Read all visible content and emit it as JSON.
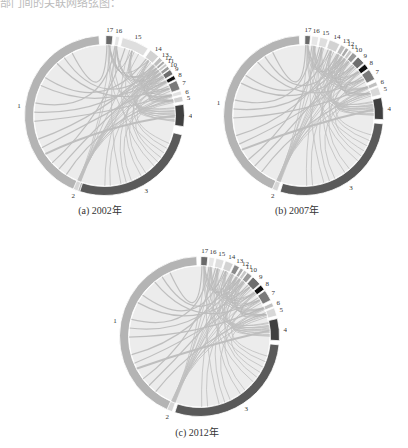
{
  "header": {
    "text": "部门间的关联网络弦图："
  },
  "chart_data": [
    {
      "type": "chord",
      "title": "(a) 2002年",
      "caption": "(a) 2002年",
      "segments": [
        {
          "id": "1",
          "start": 197,
          "end": 356,
          "color": "#b4b4b4"
        },
        {
          "id": "2",
          "start": 199.5,
          "end": 203,
          "color": "#d6d6d6"
        },
        {
          "id": "3",
          "start": 104,
          "end": 198,
          "color": "#5a5a5a"
        },
        {
          "id": "4",
          "start": 82,
          "end": 98,
          "color": "#404040"
        },
        {
          "id": "5",
          "start": 76,
          "end": 80,
          "color": "#cfcfcf"
        },
        {
          "id": "6",
          "start": 72,
          "end": 75,
          "color": "#e2e2e2"
        },
        {
          "id": "7",
          "start": 64,
          "end": 71,
          "color": "#7a7a7a"
        },
        {
          "id": "8",
          "start": 60,
          "end": 63,
          "color": "#111111"
        },
        {
          "id": "9",
          "start": 55,
          "end": 59,
          "color": "#6e6e6e"
        },
        {
          "id": "10",
          "start": 52,
          "end": 54.5,
          "color": "#9a9a9a"
        },
        {
          "id": "11",
          "start": 49.5,
          "end": 51.5,
          "color": "#c8c8c8"
        },
        {
          "id": "12",
          "start": 47,
          "end": 49,
          "color": "#aaaaaa"
        },
        {
          "id": "13",
          "start": 43.5,
          "end": 46.5,
          "color": "#bdbdbd"
        },
        {
          "id": "14",
          "start": 35,
          "end": 42.5,
          "color": "#d2d2d2"
        },
        {
          "id": "15",
          "start": 13,
          "end": 33,
          "color": "#dedede"
        },
        {
          "id": "16",
          "start": 8,
          "end": 11,
          "color": "#e6e6e6"
        },
        {
          "id": "17",
          "start": 1,
          "end": 6,
          "color": "#6a6a6a"
        }
      ]
    },
    {
      "type": "chord",
      "title": "(b) 2007年",
      "caption": "(b) 2007年",
      "segments": [
        {
          "id": "1",
          "start": 201,
          "end": 357,
          "color": "#b4b4b4"
        },
        {
          "id": "2",
          "start": 199,
          "end": 203,
          "color": "#d6d6d6"
        },
        {
          "id": "3",
          "start": 96,
          "end": 197,
          "color": "#5a5a5a"
        },
        {
          "id": "4",
          "start": 77,
          "end": 93,
          "color": "#404040"
        },
        {
          "id": "5",
          "start": 69,
          "end": 75,
          "color": "#d8d8d8"
        },
        {
          "id": "6",
          "start": 65,
          "end": 68,
          "color": "#c0c0c0"
        },
        {
          "id": "7",
          "start": 55,
          "end": 63,
          "color": "#7a7a7a"
        },
        {
          "id": "8",
          "start": 50,
          "end": 54,
          "color": "#111111"
        },
        {
          "id": "9",
          "start": 43,
          "end": 49,
          "color": "#6e6e6e"
        },
        {
          "id": "10",
          "start": 38,
          "end": 42,
          "color": "#9a9a9a"
        },
        {
          "id": "11",
          "start": 35,
          "end": 37.5,
          "color": "#c8c8c8"
        },
        {
          "id": "12",
          "start": 32,
          "end": 34.5,
          "color": "#aaaaaa"
        },
        {
          "id": "13",
          "start": 28,
          "end": 31.5,
          "color": "#bdbdbd"
        },
        {
          "id": "14",
          "start": 19,
          "end": 27,
          "color": "#d2d2d2"
        },
        {
          "id": "15",
          "start": 12,
          "end": 18,
          "color": "#dedede"
        },
        {
          "id": "16",
          "start": 6,
          "end": 11,
          "color": "#e6e6e6"
        },
        {
          "id": "17",
          "start": 1,
          "end": 5,
          "color": "#6a6a6a"
        }
      ]
    },
    {
      "type": "chord",
      "title": "(c) 2012年",
      "caption": "(c) 2012年",
      "segments": [
        {
          "id": "1",
          "start": 203,
          "end": 358,
          "color": "#b4b4b4"
        },
        {
          "id": "2",
          "start": 200,
          "end": 204,
          "color": "#d6d6d6"
        },
        {
          "id": "3",
          "start": 96,
          "end": 198,
          "color": "#5a5a5a"
        },
        {
          "id": "4",
          "start": 77,
          "end": 93,
          "color": "#404040"
        },
        {
          "id": "5",
          "start": 69,
          "end": 75,
          "color": "#d8d8d8"
        },
        {
          "id": "6",
          "start": 65,
          "end": 68,
          "color": "#c0c0c0"
        },
        {
          "id": "7",
          "start": 55,
          "end": 63,
          "color": "#7a7a7a"
        },
        {
          "id": "8",
          "start": 50,
          "end": 54,
          "color": "#111111"
        },
        {
          "id": "9",
          "start": 42,
          "end": 49,
          "color": "#6e6e6e"
        },
        {
          "id": "10",
          "start": 37,
          "end": 41,
          "color": "#9a9a9a"
        },
        {
          "id": "11",
          "start": 34,
          "end": 36.5,
          "color": "#c8c8c8"
        },
        {
          "id": "12",
          "start": 31,
          "end": 33.5,
          "color": "#aaaaaa"
        },
        {
          "id": "13",
          "start": 26,
          "end": 30,
          "color": "#8a8a8a"
        },
        {
          "id": "14",
          "start": 19,
          "end": 25,
          "color": "#d2d2d2"
        },
        {
          "id": "15",
          "start": 12,
          "end": 18,
          "color": "#dedede"
        },
        {
          "id": "16",
          "start": 7,
          "end": 11,
          "color": "#e6e6e6"
        },
        {
          "id": "17",
          "start": 1,
          "end": 6,
          "color": "#6a6a6a"
        }
      ]
    }
  ],
  "panels": [
    {
      "caption": "(a) 2002年"
    },
    {
      "caption": "(b) 2007年"
    },
    {
      "caption": "(c) 2012年"
    }
  ]
}
